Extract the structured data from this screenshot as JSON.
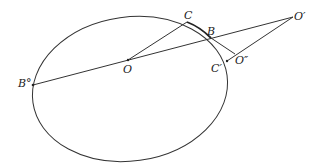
{
  "diagram": {
    "labels": {
      "C": "C",
      "B": "B",
      "O_prime": "O′",
      "O": "O",
      "B_circ": "B°",
      "O_double_prime": "O″",
      "C_prime": "C′"
    },
    "colors": {
      "stroke": "#333333",
      "text": "#222222",
      "background": "#ffffff"
    }
  }
}
